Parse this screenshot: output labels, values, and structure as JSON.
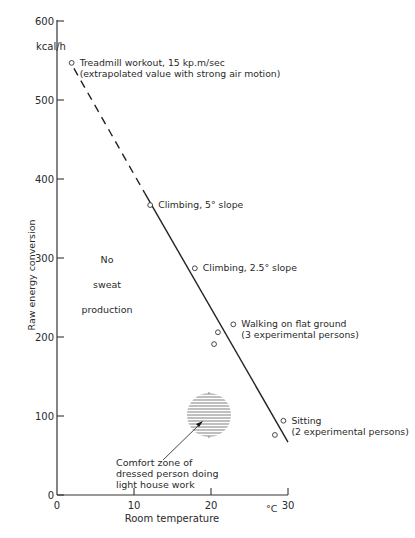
{
  "chart_data": {
    "type": "scatter",
    "title": "",
    "xlabel": "Room temperature",
    "x_unit": "°C",
    "ylabel": "Raw energy conversion",
    "y_unit": "kcal/h",
    "xlim": [
      0,
      30
    ],
    "ylim": [
      0,
      600
    ],
    "x_ticks": [
      0,
      10,
      20,
      30
    ],
    "y_ticks": [
      0,
      100,
      200,
      300,
      400,
      500,
      600
    ],
    "grid": false,
    "legend": "none",
    "series": [
      {
        "name": "Measured activities",
        "points": [
          {
            "x": 1.9,
            "y": 547,
            "label": "Treadmill workout, 15 kp.m/sec",
            "label2": "(extrapolated value with strong air motion)"
          },
          {
            "x": 12.1,
            "y": 367,
            "label": "Climbing, 5° slope"
          },
          {
            "x": 17.9,
            "y": 287,
            "label": "Climbing, 2.5° slope"
          },
          {
            "x": 22.9,
            "y": 216,
            "label": "Walking on flat ground",
            "label2": "(3 experimental persons)"
          },
          {
            "x": 20.9,
            "y": 206
          },
          {
            "x": 20.4,
            "y": 191
          },
          {
            "x": 29.4,
            "y": 94,
            "label": "Sitting",
            "label2": "(2 experimental persons)"
          },
          {
            "x": 28.3,
            "y": 76
          }
        ]
      }
    ],
    "trend_line": {
      "dashed_segment": [
        [
          2.2,
          540
        ],
        [
          11.4,
          382
        ]
      ],
      "solid_segment": [
        [
          11.4,
          382
        ],
        [
          30,
          67
        ]
      ]
    },
    "annotations": [
      {
        "text": [
          "No",
          "sweat",
          "production"
        ],
        "x": 6.5,
        "y": 270
      },
      {
        "type": "hatched-circle",
        "center": [
          19.7,
          101
        ],
        "radius_px": 22,
        "text": [
          "Comfort zone of",
          "dressed person doing",
          "light house work"
        ],
        "text_pos": [
          8,
          35
        ]
      }
    ]
  }
}
